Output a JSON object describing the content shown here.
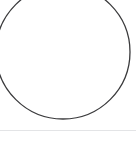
{
  "page": {
    "background_color": "#ffffff",
    "width": 136,
    "height": 144
  },
  "figure": {
    "label": "circle outline",
    "shape_type": "circle",
    "stroke_color": "#3a3a3c",
    "stroke_width": 1.3,
    "fill": "none",
    "center_x": 63,
    "center_y": 52,
    "radius": 67,
    "clipped_edges": "top, right",
    "caption": ""
  },
  "divider": {
    "label": "horizontal rule",
    "color": "#e3e4e6",
    "thickness": 1,
    "y": 130
  },
  "footer": {
    "background_color": "#ffffff",
    "text": ""
  },
  "chart_data": {
    "type": "scatter",
    "title": "",
    "xlabel": "",
    "ylabel": "",
    "annotations": [
      "circle outline"
    ],
    "grid": false,
    "legend": "none"
  }
}
